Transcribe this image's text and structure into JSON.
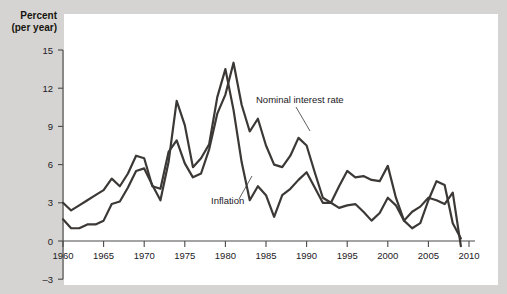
{
  "chart_data": {
    "type": "line",
    "title": "",
    "xlabel": "",
    "ylabel": "Percent (per year)",
    "ylabel_line1": "Percent",
    "ylabel_line2": "(per year)",
    "grid": false,
    "legend_position": "inline-annotations",
    "xlim": [
      1959,
      2010
    ],
    "ylim": [
      -3,
      15
    ],
    "yticks": [
      -3,
      0,
      3,
      6,
      9,
      12,
      15
    ],
    "ytick_labels": [
      "–3",
      "0",
      "3",
      "6",
      "9",
      "12",
      "15"
    ],
    "xticks": [
      1960,
      1965,
      1970,
      1975,
      1980,
      1985,
      1990,
      1995,
      2000,
      2005,
      2010
    ],
    "xtick_labels": [
      "1960",
      "1965",
      "1970",
      "1975",
      "1980",
      "1985",
      "1990",
      "1995",
      "2000",
      "2005",
      "2010"
    ],
    "line_color": "#3b3836",
    "plot_background": "#ffffff",
    "figure_background": "#d5d4d2",
    "x": [
      1960,
      1961,
      1962,
      1963,
      1964,
      1965,
      1966,
      1967,
      1968,
      1969,
      1970,
      1971,
      1972,
      1973,
      1974,
      1975,
      1976,
      1977,
      1978,
      1979,
      1980,
      1981,
      1982,
      1983,
      1984,
      1985,
      1986,
      1987,
      1988,
      1989,
      1990,
      1991,
      1992,
      1993,
      1994,
      1995,
      1996,
      1997,
      1998,
      1999,
      2000,
      2001,
      2002,
      2003,
      2004,
      2005,
      2006,
      2007,
      2008,
      2009
    ],
    "series": [
      {
        "name": "Nominal interest rate",
        "annotation": "Nominal interest rate",
        "values": [
          3.0,
          2.4,
          2.8,
          3.2,
          3.6,
          4.0,
          4.9,
          4.3,
          5.3,
          6.7,
          6.5,
          4.3,
          4.1,
          7.0,
          7.9,
          6.1,
          5.0,
          5.3,
          7.2,
          10.0,
          11.5,
          14.0,
          10.7,
          8.6,
          9.6,
          7.5,
          6.0,
          5.8,
          6.7,
          8.1,
          7.5,
          5.4,
          3.4,
          3.0,
          4.3,
          5.5,
          5.0,
          5.1,
          4.8,
          4.7,
          5.9,
          3.4,
          1.6,
          1.0,
          1.4,
          3.2,
          4.7,
          4.4,
          1.4,
          0.2
        ]
      },
      {
        "name": "Inflation",
        "annotation": "Inflation",
        "values": [
          1.7,
          1.0,
          1.0,
          1.3,
          1.3,
          1.6,
          2.9,
          3.1,
          4.2,
          5.5,
          5.7,
          4.4,
          3.2,
          6.2,
          11.0,
          9.1,
          5.8,
          6.5,
          7.6,
          11.3,
          13.5,
          10.3,
          6.2,
          3.2,
          4.3,
          3.6,
          1.9,
          3.6,
          4.1,
          4.8,
          5.4,
          4.2,
          3.0,
          3.0,
          2.6,
          2.8,
          2.9,
          2.3,
          1.6,
          2.2,
          3.4,
          2.8,
          1.6,
          2.3,
          2.7,
          3.4,
          3.2,
          2.9,
          3.8,
          -0.4
        ]
      }
    ]
  },
  "annotations": [
    {
      "id": "nominal",
      "label": "Nominal interest rate"
    },
    {
      "id": "inflation",
      "label": "Inflation"
    }
  ]
}
